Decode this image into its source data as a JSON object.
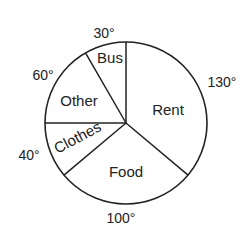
{
  "chart_data": {
    "type": "pie",
    "title": "",
    "unit": "degrees",
    "categories": [
      "Rent",
      "Food",
      "Clothes",
      "Other",
      "Bus"
    ],
    "values": [
      130,
      100,
      40,
      60,
      30
    ],
    "total": 360,
    "start_angle_deg_from_north": 0,
    "direction": "clockwise",
    "legend": "none (labels inside slices)",
    "colors": {
      "fill": "#ffffff",
      "stroke": "#222222"
    }
  },
  "labels": {
    "rent": "Rent",
    "food": "Food",
    "clothes": "Clothes",
    "other": "Other",
    "bus": "Bus"
  },
  "angles": {
    "rent": "130°",
    "food": "100°",
    "clothes": "40°",
    "other": "60°",
    "bus": "30°"
  }
}
